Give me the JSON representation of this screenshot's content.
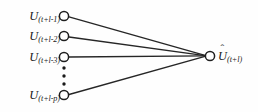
{
  "diagram": {
    "type": "neural-network-fan-in",
    "background_color": "#fefefe",
    "stroke_color": "#262626",
    "node_fill": "#ffffff",
    "input_nodes": [
      {
        "id": "u-t-l-1",
        "base": "U",
        "subscript": "(t+l-1)",
        "cx": 64,
        "cy": 16,
        "r": 4.6,
        "label_right": 55
      },
      {
        "id": "u-t-l-2",
        "base": "U",
        "subscript": "(t+l-2)",
        "cx": 64,
        "cy": 36,
        "r": 4.6,
        "label_right": 55
      },
      {
        "id": "u-t-l-3",
        "base": "U",
        "subscript": "(t+l-3)",
        "cx": 64,
        "cy": 57,
        "r": 4.6,
        "label_right": 55
      },
      {
        "id": "u-t-l-p",
        "base": "U",
        "subscript": "(t+l-p)",
        "cx": 64,
        "cy": 95,
        "r": 4.6,
        "label_right": 55
      }
    ],
    "ellipsis": {
      "name": "vertical-ellipsis",
      "cx": 64,
      "dots": [
        68,
        76,
        84
      ],
      "radius": 1.7,
      "color": "#1a1a1a"
    },
    "output_node": {
      "id": "u-hat-t-l",
      "base": "U",
      "hat": "ˆ",
      "subscript": "(t+l)",
      "cx": 210,
      "cy": 56,
      "r": 4.6,
      "label_left": 218
    },
    "edges": [
      {
        "from": "u-t-l-1",
        "to": "u-hat-t-l",
        "x1": 69,
        "y1": 16.8,
        "x2": 205,
        "y2": 55.4
      },
      {
        "from": "u-t-l-2",
        "to": "u-hat-t-l",
        "x1": 69,
        "y1": 37.0,
        "x2": 205,
        "y2": 55.6
      },
      {
        "from": "u-t-l-3",
        "to": "u-hat-t-l",
        "x1": 69,
        "y1": 57.0,
        "x2": 205,
        "y2": 55.9
      },
      {
        "from": "u-t-l-p",
        "to": "u-hat-t-l",
        "x1": 69,
        "y1": 94.5,
        "x2": 205,
        "y2": 56.4
      }
    ]
  }
}
